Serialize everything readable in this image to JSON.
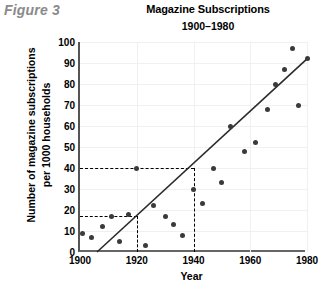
{
  "figure": {
    "caption": "Figure 3"
  },
  "chart_data": {
    "type": "scatter",
    "title": "Magazine Subscriptions",
    "subtitle": "1900–1980",
    "xlabel": "Year",
    "ylabel_line1": "Number of magazine subscriptions",
    "ylabel_line2": "per 1000 households",
    "xlim": [
      1900,
      1980
    ],
    "ylim": [
      0,
      100
    ],
    "xticks": [
      1900,
      1920,
      1940,
      1960,
      1980
    ],
    "ytick_labels": [
      "0",
      "10",
      "20",
      "30",
      "40",
      "50",
      "60",
      "70",
      "80",
      "90",
      "100"
    ],
    "yticks": [
      0,
      10,
      20,
      30,
      40,
      50,
      60,
      70,
      80,
      90,
      100
    ],
    "grid": true,
    "legend": "none",
    "points": [
      {
        "x": 1901,
        "y": 9
      },
      {
        "x": 1904,
        "y": 7
      },
      {
        "x": 1908,
        "y": 12
      },
      {
        "x": 1911,
        "y": 17
      },
      {
        "x": 1914,
        "y": 5
      },
      {
        "x": 1917,
        "y": 18
      },
      {
        "x": 1920,
        "y": 40
      },
      {
        "x": 1923,
        "y": 3
      },
      {
        "x": 1926,
        "y": 22
      },
      {
        "x": 1930,
        "y": 17
      },
      {
        "x": 1933,
        "y": 13
      },
      {
        "x": 1936,
        "y": 8
      },
      {
        "x": 1940,
        "y": 30
      },
      {
        "x": 1943,
        "y": 23
      },
      {
        "x": 1947,
        "y": 40
      },
      {
        "x": 1950,
        "y": 33
      },
      {
        "x": 1953,
        "y": 60
      },
      {
        "x": 1958,
        "y": 48
      },
      {
        "x": 1962,
        "y": 52
      },
      {
        "x": 1966,
        "y": 68
      },
      {
        "x": 1969,
        "y": 80
      },
      {
        "x": 1972,
        "y": 87
      },
      {
        "x": 1975,
        "y": 97
      },
      {
        "x": 1977,
        "y": 70
      },
      {
        "x": 1980,
        "y": 92
      }
    ],
    "trend_line": {
      "x1": 1906,
      "y1": 0,
      "x2": 1980,
      "y2": 92
    },
    "guides": [
      {
        "orientation": "horizontal",
        "value": 40,
        "from_x": 1900,
        "to_x": 1940
      },
      {
        "orientation": "horizontal",
        "value": 17,
        "from_x": 1900,
        "to_x": 1920
      },
      {
        "orientation": "vertical",
        "value": 1920,
        "from_y": 0,
        "to_y": 17
      },
      {
        "orientation": "vertical",
        "value": 1940,
        "from_y": 0,
        "to_y": 40
      }
    ]
  },
  "colors": {
    "point": "#3a3a3a",
    "trend": "#2a2a2a",
    "guide": "#000000",
    "grid": "#f0f0f0",
    "caption": "#8a8a8a"
  }
}
